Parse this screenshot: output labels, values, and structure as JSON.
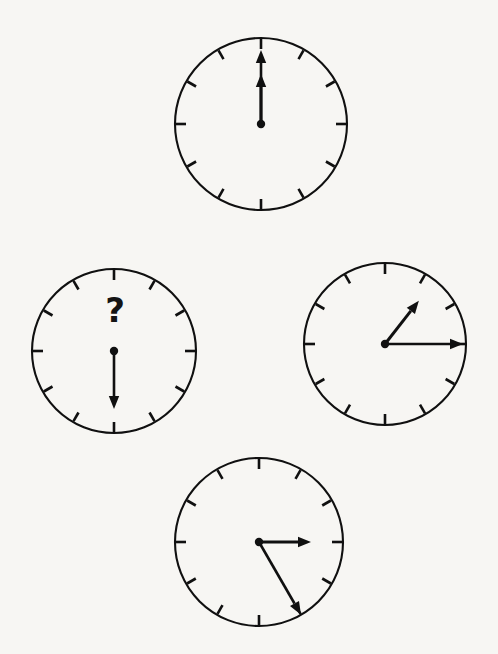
{
  "scene": {
    "title": "Analog clock sequence puzzle",
    "background_color": "#f7f6f3",
    "ink_color": "#101010",
    "width": 498,
    "height": 654,
    "layout": "diamond",
    "tick_count": 12
  },
  "question_mark": {
    "glyph": "?",
    "x": 115,
    "y": 310,
    "belongs_to_clock": "left"
  },
  "clocks": [
    {
      "id": "top",
      "position_label": "top",
      "cx": 261,
      "cy": 124,
      "r": 86,
      "time_text": "12:00",
      "hour_value": 12,
      "minute_value": 0,
      "hands": [
        {
          "type": "hour",
          "angle_deg": 0,
          "length": 50,
          "arrow": true
        },
        {
          "type": "minute",
          "angle_deg": 0,
          "length": 74,
          "arrow": true
        }
      ],
      "has_question_mark": false
    },
    {
      "id": "left",
      "position_label": "left",
      "cx": 114,
      "cy": 351,
      "r": 82,
      "time_text": "?",
      "hour_value": null,
      "minute_value": 30,
      "hands": [
        {
          "type": "minute",
          "angle_deg": 180,
          "length": 58,
          "arrow": true
        }
      ],
      "has_question_mark": true
    },
    {
      "id": "right",
      "position_label": "right",
      "cx": 385,
      "cy": 344,
      "r": 81,
      "time_text": "1:15",
      "hour_value": 1,
      "minute_value": 15,
      "hands": [
        {
          "type": "hour",
          "angle_deg": 38,
          "length": 55,
          "arrow": true
        },
        {
          "type": "minute",
          "angle_deg": 90,
          "length": 78,
          "arrow": true
        }
      ],
      "has_question_mark": false
    },
    {
      "id": "bottom",
      "position_label": "bottom",
      "cx": 259,
      "cy": 542,
      "r": 84,
      "time_text": "3:25",
      "hour_value": 3,
      "minute_value": 25,
      "hands": [
        {
          "type": "hour",
          "angle_deg": 90,
          "length": 52,
          "arrow": true
        },
        {
          "type": "minute",
          "angle_deg": 150,
          "length": 84,
          "arrow": true
        }
      ],
      "has_question_mark": false
    }
  ]
}
